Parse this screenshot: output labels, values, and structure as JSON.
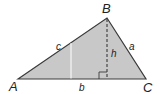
{
  "diagram": {
    "type": "triangle-area",
    "fill_color": "#c8c8c8",
    "stroke_color": "#3a3a3a",
    "vertices": {
      "A": {
        "label": "A",
        "x": 18,
        "y": 79
      },
      "B": {
        "label": "B",
        "x": 107,
        "y": 18
      },
      "C": {
        "label": "C",
        "x": 146,
        "y": 79
      }
    },
    "sides": {
      "a": {
        "label": "a"
      },
      "b": {
        "label": "b"
      },
      "c": {
        "label": "c"
      }
    },
    "height": {
      "label": "h",
      "style": "dashed"
    },
    "right_angle_marker": true,
    "divider_line_color": "#ffffff"
  }
}
